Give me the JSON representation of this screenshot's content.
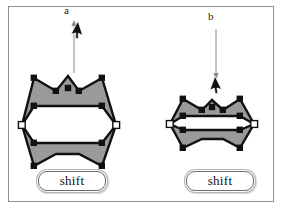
{
  "figure": {
    "background_color": "#ffffff",
    "frame_color": "#8e8e8e",
    "shape_fill_color": "#9a9a9a",
    "outline_color": "#111111",
    "node_color": "#111111",
    "endpoint_color": "#ffffff"
  },
  "panels": [
    {
      "id": "a",
      "label": "a",
      "caption": "shift",
      "cursor": "arrow-cursor-up-right",
      "drag_direction": "up",
      "arrow": {
        "x": 74,
        "y_start": 72,
        "y_end": 22
      },
      "shape_state": "expanded",
      "selected_nodes": 10,
      "endpoint_nodes": 2
    },
    {
      "id": "b",
      "label": "b",
      "caption": "shift",
      "cursor": "arrow-cursor-down-right",
      "drag_direction": "down",
      "arrow": {
        "x": 216,
        "y_start": 28,
        "y_end": 78
      },
      "shape_state": "collapsed",
      "selected_nodes": 10,
      "endpoint_nodes": 2
    }
  ],
  "shapes": {
    "a": {
      "outline": "22,125 34,78 56,91 68,76 79,91 102,78 116,125 102,166 79,154 68,154 56,154 34,166",
      "inner_top": "M 34,106 L 102,106",
      "inner_bottom": "M 34,143 L 102,143",
      "nodes": [
        [
          34,
          78
        ],
        [
          56,
          91
        ],
        [
          68,
          88
        ],
        [
          79,
          91
        ],
        [
          102,
          78
        ],
        [
          34,
          106
        ],
        [
          102,
          106
        ],
        [
          34,
          143
        ],
        [
          102,
          143
        ],
        [
          34,
          166
        ],
        [
          102,
          166
        ]
      ],
      "endpoints": [
        [
          22,
          125
        ],
        [
          116,
          125
        ]
      ]
    },
    "b": {
      "outline": "170,124 183,99 202,110 212,100 223,110 240,99 254,124 240,148 223,139 212,139 202,139 183,148",
      "inner_top": "M 183,116 L 240,116",
      "inner_bottom": "M 183,130 L 240,130",
      "nodes": [
        [
          183,
          99
        ],
        [
          202,
          110
        ],
        [
          212,
          107
        ],
        [
          223,
          110
        ],
        [
          240,
          99
        ],
        [
          183,
          116
        ],
        [
          240,
          116
        ],
        [
          183,
          130
        ],
        [
          240,
          130
        ],
        [
          183,
          148
        ],
        [
          240,
          148
        ]
      ],
      "endpoints": [
        [
          170,
          124
        ],
        [
          254,
          124
        ]
      ]
    }
  }
}
